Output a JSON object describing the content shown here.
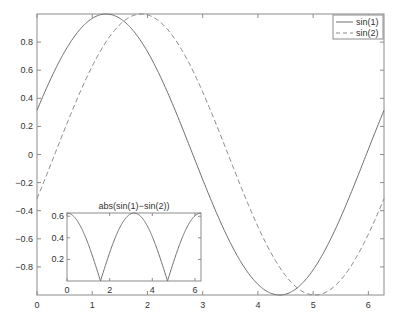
{
  "chart_data": [
    {
      "type": "line",
      "title": "",
      "xlabel": "",
      "ylabel": "",
      "xlim": [
        0,
        6.2832
      ],
      "ylim": [
        -1,
        1
      ],
      "grid": false,
      "legend_position": "upper right",
      "x_ticks": [
        "0",
        "1",
        "2",
        "3",
        "4",
        "5",
        "6"
      ],
      "y_ticks": [
        "-0.8",
        "-0.6",
        "-0.4",
        "-0.2",
        "0",
        "0.2",
        "0.4",
        "0.6",
        "0.8"
      ],
      "series": [
        {
          "name": "sin(1)",
          "style": "solid",
          "color": "#6e6e6e",
          "function": "sin(x + 0.32)"
        },
        {
          "name": "sin(2)",
          "style": "dashed",
          "color": "#8a8a8a",
          "function": "sin(x - 0.32)"
        }
      ]
    },
    {
      "type": "line",
      "title": "abs(sin(1)−sin(2))",
      "xlabel": "",
      "ylabel": "",
      "xlim": [
        0,
        6.2832
      ],
      "ylim": [
        0,
        0.63
      ],
      "grid": false,
      "x_ticks": [
        "0",
        "2",
        "4",
        "6"
      ],
      "y_ticks": [
        "0.2",
        "0.4",
        "0.6"
      ],
      "series": [
        {
          "name": "abs(sin(1)-sin(2))",
          "style": "solid",
          "color": "#6e6e6e",
          "function": "abs(sin(x+0.32) - sin(x-0.32))"
        }
      ]
    }
  ],
  "legend": {
    "items": [
      {
        "label": "sin(1)"
      },
      {
        "label": "sin(2)"
      }
    ]
  },
  "inset": {
    "title": "abs(sin(1)−sin(2))"
  }
}
